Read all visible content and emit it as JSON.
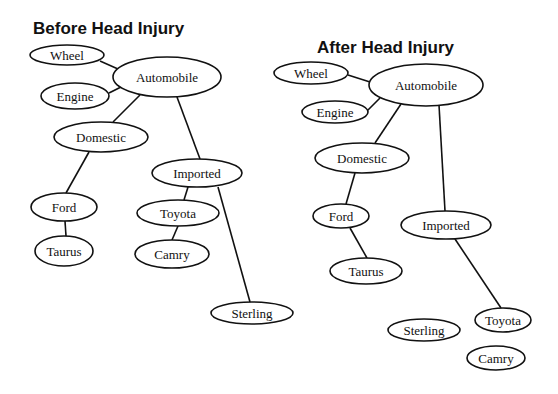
{
  "diagrams": [
    {
      "title": "Before Head Injury",
      "title_pos": [
        33,
        34
      ],
      "nodes": {
        "wheel": {
          "label": "Wheel",
          "cx": 67,
          "cy": 55,
          "rx": 37,
          "ry": 10
        },
        "automobile": {
          "label": "Automobile",
          "cx": 167,
          "cy": 77,
          "rx": 54,
          "ry": 20
        },
        "engine": {
          "label": "Engine",
          "cx": 75,
          "cy": 96,
          "rx": 34,
          "ry": 13
        },
        "domestic": {
          "label": "Domestic",
          "cx": 101,
          "cy": 137,
          "rx": 47,
          "ry": 15
        },
        "imported": {
          "label": "Imported",
          "cx": 197,
          "cy": 173,
          "rx": 45,
          "ry": 14
        },
        "ford": {
          "label": "Ford",
          "cx": 64,
          "cy": 207,
          "rx": 33,
          "ry": 14
        },
        "taurus": {
          "label": "Taurus",
          "cx": 64,
          "cy": 251,
          "rx": 29,
          "ry": 15
        },
        "toyota": {
          "label": "Toyota",
          "cx": 178,
          "cy": 213,
          "rx": 41,
          "ry": 13
        },
        "camry": {
          "label": "Camry",
          "cx": 172,
          "cy": 254,
          "rx": 37,
          "ry": 14
        },
        "sterling": {
          "label": "Sterling",
          "cx": 252,
          "cy": 313,
          "rx": 41,
          "ry": 11
        }
      },
      "edges": [
        {
          "from": "wheel",
          "to": "automobile",
          "x1": 100,
          "y1": 61,
          "x2": 118,
          "y2": 69
        },
        {
          "from": "engine",
          "to": "automobile",
          "x1": 109,
          "y1": 93,
          "x2": 121,
          "y2": 87
        },
        {
          "from": "automobile",
          "to": "domestic",
          "x1": 140,
          "y1": 95,
          "x2": 113,
          "y2": 122
        },
        {
          "from": "automobile",
          "to": "imported",
          "x1": 177,
          "y1": 97,
          "x2": 200,
          "y2": 159
        },
        {
          "from": "domestic",
          "to": "ford",
          "x1": 89,
          "y1": 152,
          "x2": 66,
          "y2": 193
        },
        {
          "from": "ford",
          "to": "taurus",
          "x1": 65,
          "y1": 221,
          "x2": 66,
          "y2": 236
        },
        {
          "from": "imported",
          "to": "toyota",
          "x1": 188,
          "y1": 187,
          "x2": 184,
          "y2": 200
        },
        {
          "from": "toyota",
          "to": "camry",
          "x1": 178,
          "y1": 226,
          "x2": 172,
          "y2": 240
        },
        {
          "from": "imported",
          "to": "sterling",
          "x1": 218,
          "y1": 187,
          "x2": 250,
          "y2": 302
        }
      ]
    },
    {
      "title": "After Head Injury",
      "title_pos": [
        317,
        53
      ],
      "nodes": {
        "wheel": {
          "label": "Wheel",
          "cx": 311,
          "cy": 73,
          "rx": 37,
          "ry": 11
        },
        "automobile": {
          "label": "Automobile",
          "cx": 426,
          "cy": 85,
          "rx": 57,
          "ry": 21
        },
        "engine": {
          "label": "Engine",
          "cx": 335,
          "cy": 112,
          "rx": 33,
          "ry": 11
        },
        "domestic": {
          "label": "Domestic",
          "cx": 362,
          "cy": 158,
          "rx": 47,
          "ry": 15
        },
        "ford": {
          "label": "Ford",
          "cx": 341,
          "cy": 216,
          "rx": 28,
          "ry": 12
        },
        "imported": {
          "label": "Imported",
          "cx": 446,
          "cy": 225,
          "rx": 45,
          "ry": 14
        },
        "taurus": {
          "label": "Taurus",
          "cx": 366,
          "cy": 271,
          "rx": 36,
          "ry": 13
        },
        "toyota": {
          "label": "Toyota",
          "cx": 503,
          "cy": 320,
          "rx": 28,
          "ry": 12
        },
        "sterling": {
          "label": "Sterling",
          "cx": 424,
          "cy": 330,
          "rx": 36,
          "ry": 11
        },
        "camry": {
          "label": "Camry",
          "cx": 496,
          "cy": 358,
          "rx": 29,
          "ry": 12
        }
      },
      "edges": [
        {
          "from": "wheel",
          "to": "automobile",
          "x1": 348,
          "y1": 75,
          "x2": 370,
          "y2": 82
        },
        {
          "from": "engine",
          "to": "automobile",
          "x1": 368,
          "y1": 110,
          "x2": 380,
          "y2": 98
        },
        {
          "from": "automobile",
          "to": "domestic",
          "x1": 401,
          "y1": 104,
          "x2": 375,
          "y2": 143
        },
        {
          "from": "automobile",
          "to": "imported",
          "x1": 439,
          "y1": 105,
          "x2": 445,
          "y2": 211
        },
        {
          "from": "domestic",
          "to": "ford",
          "x1": 355,
          "y1": 173,
          "x2": 346,
          "y2": 204
        },
        {
          "from": "ford",
          "to": "taurus",
          "x1": 350,
          "y1": 228,
          "x2": 367,
          "y2": 258
        },
        {
          "from": "imported",
          "to": "toyota",
          "x1": 455,
          "y1": 239,
          "x2": 501,
          "y2": 308
        }
      ]
    }
  ]
}
